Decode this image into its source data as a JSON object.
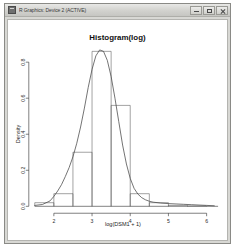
{
  "window": {
    "title": "R Graphics: Device 2 (ACTIVE)",
    "icon": "r-graphics-icon",
    "buttons": {
      "minimize": "Minimize",
      "maximize": "Maximize",
      "close": "Close"
    }
  },
  "chart_data": {
    "type": "bar",
    "title": "Histogram(log)",
    "xlabel": "log(DSM1 + 1)",
    "ylabel": "Density",
    "xlim": [
      1.5,
      6.3
    ],
    "ylim": [
      0.0,
      0.88
    ],
    "xticks": [
      2,
      3,
      4,
      5,
      6
    ],
    "xtick_labels": [
      "2",
      "3",
      "4",
      "5",
      "6"
    ],
    "yticks": [
      0.0,
      0.2,
      0.4,
      0.6,
      0.8
    ],
    "ytick_labels": [
      "0.0",
      "0.2",
      "0.4",
      "0.6",
      "0.8"
    ],
    "grid": false,
    "legend": null,
    "bin_width": 0.5,
    "bin_edges": [
      1.5,
      2.0,
      2.5,
      3.0,
      3.5,
      4.0,
      4.5,
      5.0,
      5.5,
      6.0
    ],
    "bin_labels": [
      "1.5-2.0",
      "2.0-2.5",
      "2.5-3.0",
      "3.0-3.5",
      "3.5-4.0",
      "4.0-4.5",
      "4.5-5.0",
      "5.0-5.5",
      "5.5-6.0"
    ],
    "values": [
      0.02,
      0.07,
      0.3,
      0.86,
      0.56,
      0.07,
      0.02,
      0.005,
      0.002
    ],
    "series": [
      {
        "name": "Density",
        "type": "line",
        "x": [
          1.5,
          1.7,
          1.9,
          2.0,
          2.1,
          2.2,
          2.3,
          2.4,
          2.5,
          2.6,
          2.7,
          2.8,
          2.9,
          3.0,
          3.1,
          3.2,
          3.3,
          3.4,
          3.5,
          3.6,
          3.7,
          3.8,
          3.9,
          4.0,
          4.1,
          4.2,
          4.3,
          4.4,
          4.5,
          4.6,
          4.8,
          5.0,
          5.2,
          5.4,
          5.6,
          5.8,
          6.0,
          6.2
        ],
        "y": [
          0.005,
          0.01,
          0.03,
          0.055,
          0.085,
          0.12,
          0.165,
          0.215,
          0.275,
          0.35,
          0.44,
          0.545,
          0.66,
          0.76,
          0.835,
          0.868,
          0.86,
          0.81,
          0.72,
          0.6,
          0.47,
          0.34,
          0.235,
          0.155,
          0.1,
          0.068,
          0.048,
          0.036,
          0.028,
          0.023,
          0.018,
          0.015,
          0.013,
          0.011,
          0.009,
          0.007,
          0.005,
          0.003
        ]
      }
    ]
  }
}
